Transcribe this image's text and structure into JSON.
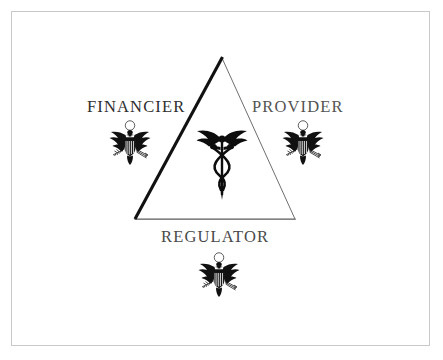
{
  "figure": {
    "background_color": "#ffffff",
    "frame_color": "#c9c9c9"
  },
  "triangle": {
    "name": "healthcare-triad-triangle",
    "apex": {
      "x": 222,
      "y": 57
    },
    "bottom_left": {
      "x": 135,
      "y": 219
    },
    "bottom_right": {
      "x": 295,
      "y": 219
    },
    "left_edge_color": "#111111",
    "left_edge_width": "3",
    "right_edge_color": "#6e6e6e",
    "right_edge_width": "1",
    "bottom_edge_color": "#5a5a5a",
    "bottom_edge_width": "1.2"
  },
  "nodes": [
    {
      "id": "financier",
      "label": "FINANCIER",
      "color": "#2e2e2e",
      "icon": "us-eagle-seal-icon",
      "position": "left"
    },
    {
      "id": "provider",
      "label": "PROVIDER",
      "color": "#545454",
      "icon": "us-eagle-seal-icon",
      "position": "right"
    },
    {
      "id": "regulator",
      "label": "REGULATOR",
      "color": "#4a4a4a",
      "icon": "us-eagle-seal-icon",
      "position": "bottom"
    }
  ],
  "center_symbol": {
    "name": "caduceus-icon",
    "label": "Caduceus",
    "color": "#0d0d0d"
  }
}
